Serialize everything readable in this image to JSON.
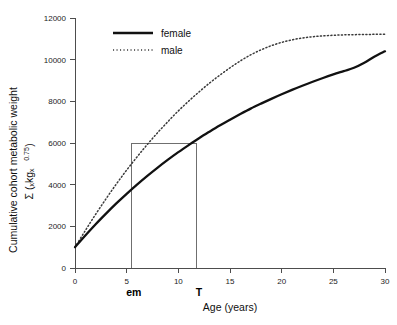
{
  "chart_data": {
    "type": "line",
    "title": "",
    "xlabel": "Age (years)",
    "ylabel_line1": "Cumulative cohort metabolic weight",
    "ylabel_line2": "Σ (ₓkgₓ",
    "ylabel_exponent": "0.75",
    "ylabel_line2_close": ")",
    "xlim": [
      0,
      30
    ],
    "ylim": [
      0,
      12000
    ],
    "grid": false,
    "legend_position": "top-left",
    "x_ticks": [
      "0",
      "5",
      "10",
      "15",
      "20",
      "25",
      "30"
    ],
    "x_tick_values": [
      0,
      5,
      10,
      15,
      20,
      25,
      30
    ],
    "y_ticks": [
      "0",
      "2000",
      "4000",
      "6000",
      "8000",
      "10000",
      "12000"
    ],
    "y_tick_values": [
      0,
      2000,
      4000,
      6000,
      8000,
      10000,
      12000
    ],
    "series": [
      {
        "name": "female",
        "style": "solid",
        "color": "#111111",
        "x": [
          0,
          1,
          2,
          3,
          4,
          5,
          6,
          7,
          8,
          9,
          10,
          11,
          12,
          13,
          14,
          15,
          16,
          17,
          18,
          19,
          20,
          21,
          22,
          23,
          24,
          25,
          26,
          27,
          28,
          29,
          30
        ],
        "values": [
          1000,
          1560,
          2100,
          2610,
          3100,
          3560,
          4000,
          4420,
          4820,
          5200,
          5560,
          5900,
          6230,
          6540,
          6840,
          7120,
          7390,
          7650,
          7890,
          8120,
          8340,
          8550,
          8750,
          8940,
          9120,
          9290,
          9450,
          9610,
          9850,
          10150,
          10400
        ]
      },
      {
        "name": "male",
        "style": "dotted",
        "color": "#3a3a3a",
        "x": [
          0,
          1,
          2,
          3,
          4,
          5,
          6,
          7,
          8,
          9,
          10,
          11,
          12,
          13,
          14,
          15,
          16,
          17,
          18,
          19,
          20,
          21,
          22,
          23,
          24,
          25,
          26,
          27,
          28,
          29,
          30
        ],
        "values": [
          1000,
          1800,
          2580,
          3320,
          4030,
          4700,
          5330,
          5930,
          6500,
          7030,
          7540,
          8010,
          8450,
          8870,
          9250,
          9610,
          9940,
          10230,
          10470,
          10670,
          10830,
          10950,
          11040,
          11100,
          11140,
          11170,
          11190,
          11200,
          11210,
          11215,
          11220
        ]
      }
    ],
    "legend": [
      {
        "label": "female",
        "style": "solid"
      },
      {
        "label": "male",
        "style": "dotted"
      }
    ],
    "annotations": [
      {
        "label": "em",
        "x": 5.5,
        "y": 6000,
        "description": "male curve reaches 6000 at age em"
      },
      {
        "label": "T",
        "x": 11.8,
        "y": 6000,
        "description": "female curve reaches 6000 at age T"
      }
    ],
    "reference_lines": {
      "horizontal_y": 6000,
      "horizontal_x_from": 5.5,
      "horizontal_x_to": 11.8,
      "vertical_x": [
        5.5,
        11.8
      ],
      "color": "#6f6f6f"
    }
  }
}
